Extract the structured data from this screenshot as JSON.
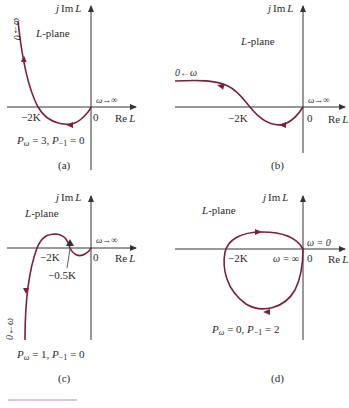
{
  "panels": [
    {
      "id": "a",
      "caption": "(a)",
      "plane_label_it": "L",
      "plane_label": "-plane",
      "y_axis_label_j": "j",
      "y_axis_label": "Im",
      "y_axis_label_it": "L",
      "x_axis_label": "Re",
      "x_axis_label_it": "L",
      "origin_label": "0",
      "crossing_label": "−2K",
      "omega_start": "ω→0",
      "omega_end": "ω→∞",
      "p_label": "P",
      "p_omega_sub": "ω",
      "p_omega_val": " = 3, ",
      "p_minus1_sub": "−1",
      "p_minus1_val": " = 0"
    },
    {
      "id": "b",
      "caption": "(b)",
      "plane_label_it": "L",
      "plane_label": "-plane",
      "y_axis_label_j": "j",
      "y_axis_label": "Im",
      "y_axis_label_it": "L",
      "x_axis_label": "Re",
      "x_axis_label_it": "L",
      "origin_label": "0",
      "crossing_label": "−2K",
      "omega_start": "0←ω",
      "omega_end": "ω→∞"
    },
    {
      "id": "c",
      "caption": "(c)",
      "plane_label_it": "L",
      "plane_label": "-plane",
      "y_axis_label_j": "j",
      "y_axis_label": "Im",
      "y_axis_label_it": "L",
      "x_axis_label": "Re",
      "x_axis_label_it": "L",
      "origin_label": "0",
      "crossing_label": "−2K",
      "crossing_label_2": "−0.5K",
      "omega_start": "0←ω",
      "omega_end": "ω→∞",
      "p_label": "P",
      "p_omega_sub": "ω",
      "p_omega_val": " = 1, ",
      "p_minus1_sub": "−1",
      "p_minus1_val": " = 0"
    },
    {
      "id": "d",
      "caption": "(d)",
      "plane_label_it": "L",
      "plane_label": "-plane",
      "y_axis_label_j": "j",
      "y_axis_label": "Im",
      "y_axis_label_it": "L",
      "x_axis_label": "Re",
      "x_axis_label_it": "L",
      "origin_label": "0",
      "crossing_label": "−2K",
      "omega_start": "ω = 0",
      "omega_end": "ω = ∞",
      "p_label": "P",
      "p_omega_sub": "ω",
      "p_omega_val": " = 0, ",
      "p_minus1_sub": "−1",
      "p_minus1_val": " = 2"
    }
  ],
  "colors": {
    "curve": "#7a1f3d",
    "axis": "#333333",
    "footer_rule": "#c98a95"
  }
}
